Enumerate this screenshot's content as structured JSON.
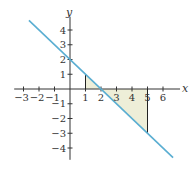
{
  "chart_data": {
    "type": "line",
    "title": "",
    "xlabel": "x",
    "ylabel": "y",
    "xlim": [
      -3.6,
      7.1
    ],
    "ylim": [
      -4.8,
      4.9
    ],
    "x_ticks": [
      -3,
      -2,
      -1,
      1,
      2,
      3,
      4,
      5,
      6
    ],
    "x_tick_labels": [
      "−3",
      "−2",
      "−1",
      "1",
      "2",
      "3",
      "4",
      "5",
      "6"
    ],
    "y_ticks": [
      4,
      3,
      2,
      1,
      -1,
      -2,
      -3,
      -4
    ],
    "y_tick_labels": [
      "4",
      "3",
      "2",
      "1",
      "−1",
      "−2",
      "−3",
      "−4"
    ],
    "grid": false,
    "series": [
      {
        "name": "y = 2 − x",
        "equation": "y = 2 - x",
        "x": [
          -2.65,
          6.65
        ],
        "y": [
          4.65,
          -4.65
        ],
        "color": "#5aaed2"
      }
    ],
    "shaded_regions": [
      {
        "name": "region-1-to-2",
        "vertices": [
          [
            1,
            0
          ],
          [
            1,
            1
          ],
          [
            2,
            0
          ]
        ],
        "color": "#eeeed8"
      },
      {
        "name": "region-2-to-5",
        "vertices": [
          [
            2,
            0
          ],
          [
            5,
            -3
          ],
          [
            5,
            0
          ]
        ],
        "color": "#eeeed8"
      }
    ],
    "vertical_segments": [
      {
        "x": 1,
        "y_from": 0,
        "y_to": 1
      },
      {
        "x": 5,
        "y_from": 0,
        "y_to": -3
      }
    ]
  },
  "colors": {
    "axis": "#333333",
    "line": "#5aaed2",
    "fill": "#eeeed8",
    "segment": "#222222"
  }
}
